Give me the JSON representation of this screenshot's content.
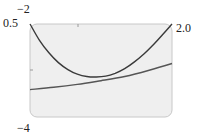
{
  "chart_data": {
    "type": "line",
    "title": "",
    "xlabel": "",
    "ylabel": "",
    "xlim": [
      0.5,
      2.0
    ],
    "ylim": [
      -4,
      -2
    ],
    "grid": false,
    "legend": null,
    "axis_labels": {
      "y_top": "−2",
      "y_bottom": "−4",
      "x_left": "0.5",
      "x_right": "2.0"
    },
    "series": [
      {
        "name": "upper curve",
        "color": "#3a3a3a",
        "x": [
          0.5,
          0.6,
          0.7,
          0.8,
          0.9,
          1.0,
          1.1,
          1.2,
          1.3,
          1.4,
          1.5,
          1.6,
          1.7,
          1.8,
          1.9,
          2.0
        ],
        "y": [
          -2.0,
          -2.35,
          -2.62,
          -2.83,
          -2.98,
          -3.08,
          -3.13,
          -3.14,
          -3.12,
          -3.06,
          -2.96,
          -2.82,
          -2.65,
          -2.45,
          -2.23,
          -2.0
        ]
      },
      {
        "name": "lower curve",
        "color": "#555555",
        "x": [
          0.5,
          0.75,
          1.0,
          1.25,
          1.5,
          1.75,
          2.0
        ],
        "y": [
          -3.41,
          -3.36,
          -3.3,
          -3.22,
          -3.13,
          -3.0,
          -2.85
        ]
      }
    ]
  },
  "colors": {
    "plot_bg": "#efefef",
    "frame": "#c8c8c8",
    "curve": "#3a3a3a"
  }
}
